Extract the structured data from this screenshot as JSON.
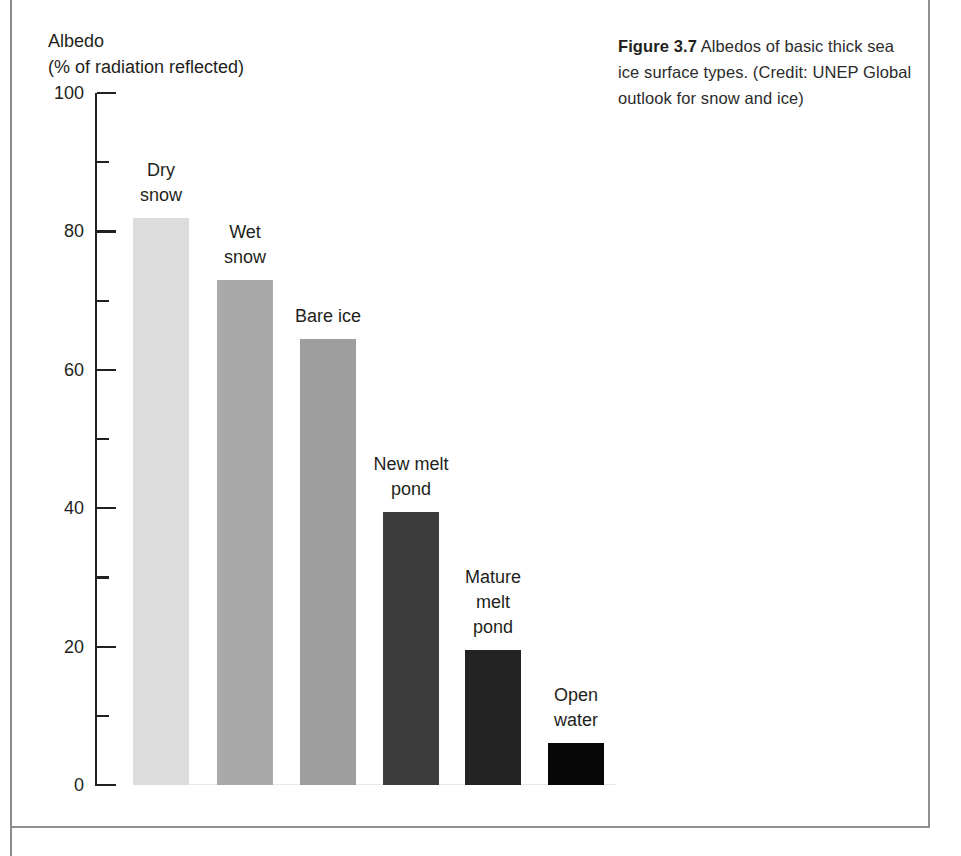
{
  "figure": {
    "caption_label": "Figure 3.7",
    "caption_text": " Albedos of basic thick sea ice surface types. (Credit: UNEP Global outlook for snow and ice)"
  },
  "axis": {
    "title_line1": "Albedo",
    "title_line2": "(% of radiation reflected)"
  },
  "chart_data": {
    "type": "bar",
    "title": "Albedos of basic thick sea ice surface types",
    "xlabel": "",
    "ylabel": "Albedo (% of radiation reflected)",
    "ylim": [
      0,
      100
    ],
    "grid": false,
    "legend": "none",
    "ytick_labels": [
      "0",
      "20",
      "40",
      "60",
      "80",
      "100"
    ],
    "ytick_values": [
      0,
      20,
      40,
      60,
      80,
      100
    ],
    "yminor_tick_values": [
      10,
      30,
      50,
      70,
      90
    ],
    "categories": [
      "Dry snow",
      "Wet snow",
      "Bare ice",
      "New melt pond",
      "Mature melt pond",
      "Open water"
    ],
    "category_label_lines": [
      [
        "Dry",
        "snow"
      ],
      [
        "Wet",
        "snow"
      ],
      [
        "Bare ice"
      ],
      [
        "New melt",
        "pond"
      ],
      [
        "Mature",
        "melt",
        "pond"
      ],
      [
        "Open",
        "water"
      ]
    ],
    "values": [
      82,
      73,
      64.5,
      39.5,
      19.5,
      6
    ],
    "bar_colors": [
      "#dcdcdc",
      "#a9a9a9",
      "#9e9e9e",
      "#3c3c3c",
      "#232323",
      "#070707"
    ],
    "units": "% of radiation reflected"
  },
  "colors": {
    "text": "#231f20",
    "frame": "#8f8f8f",
    "background": "#ffffff"
  }
}
